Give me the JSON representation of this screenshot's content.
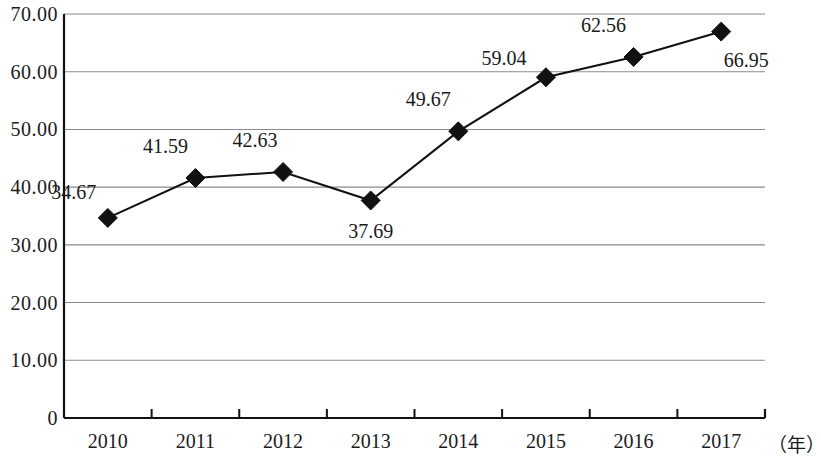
{
  "chart_data": {
    "type": "line",
    "title": "",
    "xlabel": "（年）",
    "ylabel": "",
    "categories": [
      "2010",
      "2011",
      "2012",
      "2013",
      "2014",
      "2015",
      "2016",
      "2017"
    ],
    "values": [
      34.67,
      41.59,
      42.63,
      37.69,
      49.67,
      59.04,
      62.56,
      66.95
    ],
    "point_labels": [
      "34.67",
      "41.59",
      "42.63",
      "37.69",
      "49.67",
      "59.04",
      "62.56",
      "66.95"
    ],
    "ylim": [
      0,
      70
    ],
    "ytick_labels": [
      "70.00",
      "60.00",
      "50.00",
      "40.00",
      "30.00",
      "20.00",
      "10.00",
      "0"
    ],
    "ytick_values": [
      70,
      60,
      50,
      40,
      30,
      20,
      10,
      0
    ],
    "grid": true,
    "legend": "none",
    "series": [
      {
        "name": "",
        "values": [
          34.67,
          41.59,
          42.63,
          37.69,
          49.67,
          59.04,
          62.56,
          66.95
        ],
        "marker": "diamond",
        "color": "#111111"
      }
    ],
    "colors": {
      "line": "#111111",
      "marker": "#111111",
      "grid": "#8a8a8a",
      "axis": "#111111",
      "text": "#1a1a1a",
      "background": "#ffffff"
    },
    "label_offsets": [
      {
        "dx": -34,
        "dy": -26
      },
      {
        "dx": -30,
        "dy": -32
      },
      {
        "dx": -28,
        "dy": -32
      },
      {
        "dx": 0,
        "dy": 31
      },
      {
        "dx": -30,
        "dy": -32
      },
      {
        "dx": -42,
        "dy": -19
      },
      {
        "dx": -30,
        "dy": -32
      },
      {
        "dx": 25,
        "dy": 28
      }
    ]
  }
}
